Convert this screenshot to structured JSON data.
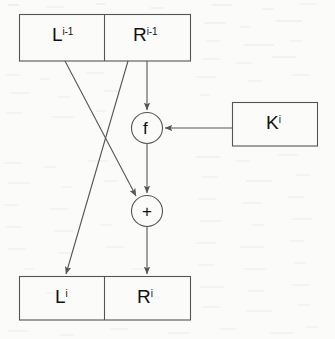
{
  "figure": {
    "kind": "feistel-round-diagram",
    "background_color": "#fbfbfa",
    "stroke_color": "#555555",
    "text_color": "#111111"
  },
  "top_block": {
    "left_cell": {
      "base": "L",
      "superscript": "i-1"
    },
    "right_cell": {
      "base": "R",
      "superscript": "i-1"
    }
  },
  "bottom_block": {
    "left_cell": {
      "base": "L",
      "superscript": "i"
    },
    "right_cell": {
      "base": "R",
      "superscript": "i"
    }
  },
  "key_block": {
    "base": "K",
    "superscript": "i"
  },
  "function_node": {
    "label": "f"
  },
  "xor_node": {
    "label": "+"
  }
}
